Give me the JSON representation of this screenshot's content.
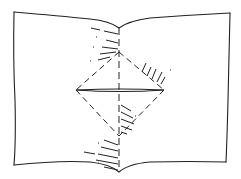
{
  "diagram": {
    "colors": {
      "ink": "#222222",
      "paper": "#ffffff"
    },
    "elements": {
      "sheet": "open-book-outline",
      "center_crease": "dashed-vertical-line",
      "diamond": "dashed-diamond-fold",
      "horizontal_fold": "double-solid-line",
      "hatching": [
        "upper-left-hatch",
        "upper-right-hatch",
        "lower-center-hatch",
        "bottom-hatch"
      ]
    }
  }
}
